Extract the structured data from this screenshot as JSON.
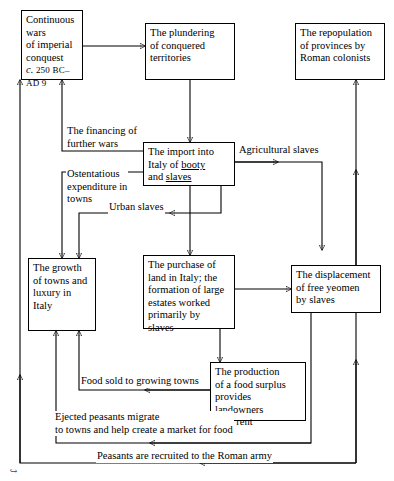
{
  "diagram": {
    "type": "flowchart",
    "background_color": "#ffffff",
    "line_color": "#000000",
    "text_color": "#000000",
    "nodes": {
      "continuous_wars": {
        "id": "continuous-wars",
        "lines": [
          "Continuous",
          "wars",
          "of imperial",
          "conquest"
        ],
        "date_prefix": "c.",
        "date_text": "250 BC–",
        "date_second_line": "AD 9"
      },
      "plundering": {
        "id": "plundering-of-conquered-territories",
        "lines": [
          "The plundering",
          "of conquered",
          "territories"
        ]
      },
      "repopulation": {
        "id": "repopulation-of-provinces",
        "lines": [
          "The repopulation",
          "of provinces by",
          "Roman colonists"
        ]
      },
      "import_italy": {
        "id": "import-into-italy",
        "line1": "The import into",
        "line2_prefix": "Italy of ",
        "line2_underlined": "booty",
        "line3_prefix": "and ",
        "line3_underlined": "slaves"
      },
      "growth_towns": {
        "id": "growth-of-towns-and-luxury",
        "lines": [
          "The growth",
          "of towns and",
          "luxury in",
          "Italy"
        ]
      },
      "purchase_land": {
        "id": "purchase-of-land-in-italy",
        "lines": [
          "The purchase of",
          "land in Italy; the",
          "formation of large",
          "estates worked",
          "primarily by",
          "slaves"
        ]
      },
      "displacement": {
        "id": "displacement-of-free-yeomen",
        "lines": [
          "The displacement",
          "of free yeomen",
          "by slaves"
        ]
      },
      "food_surplus": {
        "id": "production-of-food-surplus",
        "lines": [
          "The production",
          "of a food surplus",
          "provides landowners",
          "with rent"
        ]
      }
    },
    "edge_labels": {
      "financing": {
        "id": "financing-of-further-wars",
        "line1": "The financing of",
        "line2": "further wars"
      },
      "ostentatious": {
        "id": "ostentatious-expenditure",
        "line1": "Ostentatious",
        "line2": "expenditure in",
        "line3": "towns"
      },
      "urban_slaves": {
        "id": "urban-slaves",
        "text": "Urban slaves"
      },
      "agricultural_slaves": {
        "id": "agricultural-slaves",
        "text": "Agricultural slaves"
      },
      "food_sold": {
        "id": "food-sold-to-growing-towns",
        "text": "Food sold to growing towns"
      },
      "ejected_peasants": {
        "id": "ejected-peasants-migrate",
        "line1": "Ejected peasants migrate",
        "line2": "to towns and help create a market for food"
      },
      "recruited": {
        "id": "peasants-recruited-to-roman-army",
        "text": "Peasants are recruited to the Roman army"
      }
    }
  }
}
